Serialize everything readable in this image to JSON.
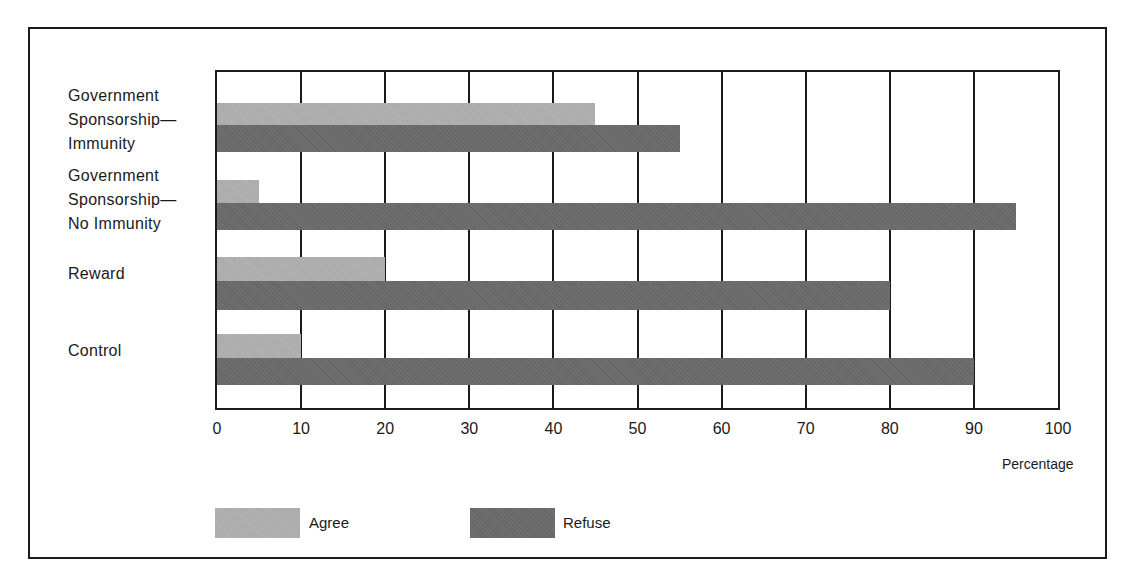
{
  "chart_data": {
    "type": "bar",
    "orientation": "horizontal",
    "title": "",
    "xlabel": "Percentage",
    "ylabel": "",
    "xlim": [
      0,
      100
    ],
    "x_ticks": [
      "0",
      "10",
      "20",
      "30",
      "40",
      "50",
      "60",
      "70",
      "80",
      "90",
      "100"
    ],
    "grid": true,
    "legend_position": "bottom",
    "categories": [
      "Government Sponsorship— Immunity",
      "Government Sponsorship— No Immunity",
      "Reward",
      "Control"
    ],
    "category_lines": [
      [
        "Government",
        "Sponsorship—",
        "Immunity"
      ],
      [
        "Government",
        "Sponsorship—",
        "No Immunity"
      ],
      [
        "Reward"
      ],
      [
        "Control"
      ]
    ],
    "series": [
      {
        "name": "Agree",
        "color": "#ababab",
        "values": [
          45,
          5,
          20,
          10
        ]
      },
      {
        "name": "Refuse",
        "color": "#6f6f6f",
        "values": [
          55,
          95,
          80,
          90
        ]
      }
    ]
  },
  "legend": {
    "agree_label": "Agree",
    "refuse_label": "Refuse"
  }
}
